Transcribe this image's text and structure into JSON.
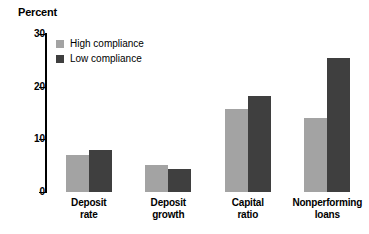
{
  "chart_data": {
    "type": "bar",
    "title": "Percent",
    "xlabel": "",
    "ylabel": "Percent",
    "ylim": [
      0,
      30
    ],
    "yticks": [
      0,
      10,
      20,
      30
    ],
    "grid": false,
    "legend_position": "top-left",
    "categories": [
      "Deposit rate",
      "Deposit growth",
      "Capital ratio",
      "Nonperforming loans"
    ],
    "category_lines": [
      [
        "Deposit",
        "rate"
      ],
      [
        "Deposit",
        "growth"
      ],
      [
        "Capital",
        "ratio"
      ],
      [
        "Nonperforming",
        "loans"
      ]
    ],
    "series": [
      {
        "name": "High compliance",
        "color": "#a3a3a3",
        "values": [
          7.0,
          5.1,
          15.8,
          14.1
        ]
      },
      {
        "name": "Low compliance",
        "color": "#3f3f3f",
        "values": [
          8.0,
          4.3,
          18.2,
          25.4
        ]
      }
    ]
  },
  "colors": {
    "high_compliance": "#a3a3a3",
    "low_compliance": "#3f3f3f",
    "axis": "#000000",
    "background": "#ffffff"
  }
}
